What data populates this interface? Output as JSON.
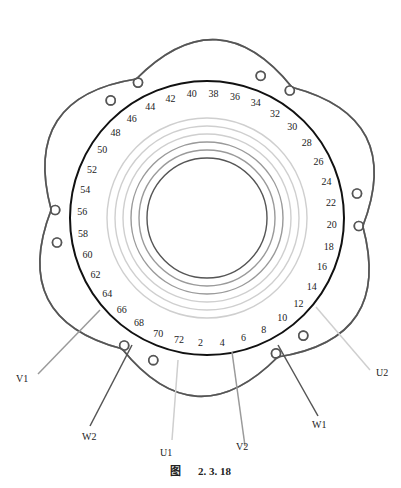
{
  "figure": {
    "caption_prefix": "图",
    "caption_number": "2. 3. 18",
    "type": "stator winding connection diagram",
    "slot_count_labels": [
      2,
      4,
      6,
      8,
      10,
      12,
      14,
      16,
      18,
      20,
      22,
      24,
      26,
      28,
      30,
      32,
      34,
      36,
      38,
      40,
      42,
      44,
      46,
      48,
      50,
      52,
      54,
      56,
      58,
      60,
      62,
      64,
      66,
      68,
      70,
      72
    ],
    "terminals": [
      {
        "id": "U1",
        "label": "U1"
      },
      {
        "id": "U2",
        "label": "U2"
      },
      {
        "id": "V1",
        "label": "V1"
      },
      {
        "id": "V2",
        "label": "V2"
      },
      {
        "id": "W1",
        "label": "W1"
      },
      {
        "id": "W2",
        "label": "W2"
      }
    ],
    "colors": {
      "dark": "#4a4a4a",
      "medium": "#8a8a8a",
      "light": "#c8c8c8",
      "stator_ring": "#111111"
    }
  }
}
